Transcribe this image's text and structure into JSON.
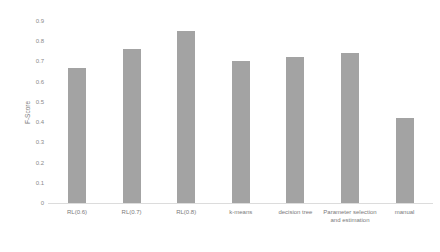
{
  "chart_data": {
    "type": "bar",
    "title": "",
    "xlabel": "",
    "ylabel": "F-Score",
    "ylim": [
      0,
      0.9
    ],
    "yticks": [
      "0",
      "0.1",
      "0.2",
      "0.3",
      "0.4",
      "0.5",
      "0.6",
      "0.7",
      "0.8",
      "0.9"
    ],
    "grid": false,
    "legend": null,
    "categories": [
      "RL(0.6)",
      "RL(0.7)",
      "RL(0.8)",
      "k-means",
      "decision tree",
      "Parameter selection and estimation",
      "manual"
    ],
    "values": [
      0.67,
      0.76,
      0.85,
      0.7,
      0.72,
      0.74,
      0.42
    ],
    "bar_color": "#a3a3a3"
  }
}
